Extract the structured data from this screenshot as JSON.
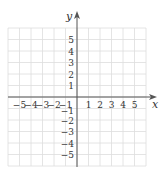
{
  "chart_data": {
    "type": "scatter",
    "title": "",
    "xlabel": "x",
    "ylabel": "y",
    "xlim": [
      -6,
      6
    ],
    "ylim": [
      -6,
      6
    ],
    "grid": true,
    "x_ticks": [
      -5,
      -4,
      -3,
      -2,
      -1,
      1,
      2,
      3,
      4,
      5
    ],
    "y_ticks": [
      5,
      4,
      3,
      2,
      1,
      -1,
      -2,
      -3,
      -4,
      -5
    ],
    "x_tick_labels": [
      "−5",
      "−4",
      "−3",
      "−2",
      "−1",
      "1",
      "2",
      "3",
      "4",
      "5"
    ],
    "y_tick_labels": [
      "5",
      "4",
      "3",
      "2",
      "1",
      "−1",
      "−2",
      "−3",
      "−4",
      "−5"
    ],
    "series": []
  },
  "colors": {
    "axis": "#555555",
    "grid": "#dddddd",
    "text": "#333333"
  }
}
